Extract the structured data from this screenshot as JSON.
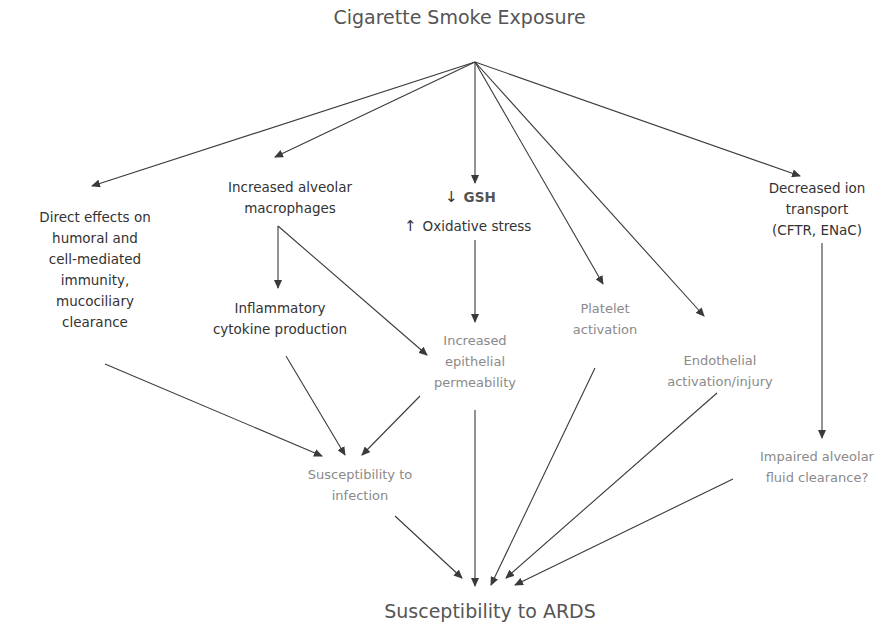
{
  "diagram": {
    "title": "Cigarette Smoke Exposure",
    "outcome": "Susceptibility to ARDS",
    "hub": {
      "x": 475,
      "y": 62
    },
    "nodes": {
      "direct_effects": {
        "lines": [
          "Direct effects on",
          "humoral and",
          "cell-mediated",
          "immunity,",
          "mucociliary",
          "clearance"
        ],
        "style": "dark"
      },
      "macrophages": {
        "lines": [
          "Increased alveolar",
          "macrophages"
        ],
        "style": "dark"
      },
      "gsh": {
        "down_arrow": "↓",
        "label": "GSH",
        "style": "dark"
      },
      "oxidative": {
        "up_arrow": "↑",
        "label": "Oxidative stress",
        "style": "dark"
      },
      "ion_transport": {
        "lines": [
          "Decreased ion",
          "transport",
          "(CFTR, ENaC)"
        ],
        "style": "dark"
      },
      "cytokine": {
        "lines": [
          "Inflammatory",
          "cytokine production"
        ],
        "style": "dark"
      },
      "permeability": {
        "lines": [
          "Increased",
          "epithelial",
          "permeability"
        ],
        "style": "gray"
      },
      "platelet": {
        "lines": [
          "Platelet",
          "activation"
        ],
        "style": "gray"
      },
      "endothelial": {
        "lines": [
          "Endothelial",
          "activation/injury"
        ],
        "style": "gray"
      },
      "infection": {
        "lines": [
          "Susceptibility to",
          "infection"
        ],
        "style": "gray"
      },
      "fluid_clearance": {
        "lines": [
          "Impaired alveolar",
          "fluid clearance?"
        ],
        "style": "gray"
      }
    },
    "edges": [
      {
        "from": "Cigarette Smoke Exposure",
        "to": "Direct effects on humoral and cell-mediated immunity, mucociliary clearance",
        "x1": 475,
        "y1": 62,
        "x2": 92,
        "y2": 186
      },
      {
        "from": "Cigarette Smoke Exposure",
        "to": "Increased alveolar macrophages",
        "x1": 475,
        "y1": 62,
        "x2": 275,
        "y2": 157
      },
      {
        "from": "Cigarette Smoke Exposure",
        "to": "GSH / Oxidative stress",
        "x1": 475,
        "y1": 62,
        "x2": 475,
        "y2": 183
      },
      {
        "from": "Cigarette Smoke Exposure",
        "to": "Platelet activation",
        "x1": 475,
        "y1": 62,
        "x2": 603,
        "y2": 284
      },
      {
        "from": "Cigarette Smoke Exposure",
        "to": "Endothelial activation/injury",
        "x1": 475,
        "y1": 62,
        "x2": 704,
        "y2": 316
      },
      {
        "from": "Cigarette Smoke Exposure",
        "to": "Decreased ion transport (CFTR, ENaC)",
        "x1": 475,
        "y1": 62,
        "x2": 800,
        "y2": 176
      },
      {
        "from": "Increased alveolar macrophages",
        "to": "Inflammatory cytokine production",
        "x1": 278,
        "y1": 226,
        "x2": 278,
        "y2": 288
      },
      {
        "from": "Increased alveolar macrophages",
        "to": "Increased epithelial permeability",
        "x1": 278,
        "y1": 226,
        "x2": 427,
        "y2": 355
      },
      {
        "from": "Oxidative stress",
        "to": "Increased epithelial permeability",
        "x1": 475,
        "y1": 240,
        "x2": 475,
        "y2": 322
      },
      {
        "from": "Decreased ion transport (CFTR, ENaC)",
        "to": "Impaired alveolar fluid clearance?",
        "x1": 822,
        "y1": 243,
        "x2": 822,
        "y2": 438
      },
      {
        "from": "Direct effects",
        "to": "Susceptibility to infection",
        "x1": 105,
        "y1": 364,
        "x2": 322,
        "y2": 456
      },
      {
        "from": "Inflammatory cytokine production",
        "to": "Susceptibility to infection",
        "x1": 286,
        "y1": 356,
        "x2": 345,
        "y2": 455
      },
      {
        "from": "Increased epithelial permeability",
        "to": "Susceptibility to infection",
        "x1": 420,
        "y1": 396,
        "x2": 362,
        "y2": 455
      },
      {
        "from": "Susceptibility to infection",
        "to": "Susceptibility to ARDS",
        "x1": 395,
        "y1": 516,
        "x2": 462,
        "y2": 578
      },
      {
        "from": "Increased epithelial permeability",
        "to": "Susceptibility to ARDS",
        "x1": 475,
        "y1": 410,
        "x2": 475,
        "y2": 586
      },
      {
        "from": "Platelet activation",
        "to": "Susceptibility to ARDS",
        "x1": 595,
        "y1": 368,
        "x2": 491,
        "y2": 585
      },
      {
        "from": "Endothelial activation/injury",
        "to": "Susceptibility to ARDS",
        "x1": 717,
        "y1": 393,
        "x2": 506,
        "y2": 578
      },
      {
        "from": "Impaired alveolar fluid clearance?",
        "to": "Susceptibility to ARDS",
        "x1": 733,
        "y1": 479,
        "x2": 515,
        "y2": 585
      }
    ],
    "colors": {
      "dark_text": "#333333",
      "gray_text": "#8a8a8a",
      "title_text": "#555555",
      "arrow": "#3a3a3a"
    }
  }
}
